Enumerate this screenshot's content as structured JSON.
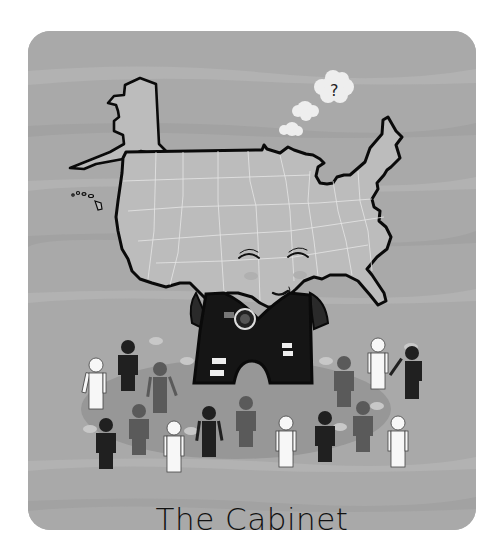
{
  "illustration": {
    "title": "The Cabinet",
    "thought_bubble_text": "?",
    "colors": {
      "background": "#a9a9a9",
      "stripe_light": "#b4b4b4",
      "stripe_dark": "#a0a0a0",
      "map_fill": "#bcbcbc",
      "map_outline": "#0a0a0a",
      "state_lines": "#e6e6e6",
      "shadow_ellipse": "#979797",
      "bubble": "#eeeeee",
      "suit": "#151515",
      "figure_white": "#f7f7f7",
      "figure_black": "#202020",
      "figure_gray": "#5a5a5a"
    },
    "figures": [
      {
        "tone": "white",
        "x": 52,
        "y": 316
      },
      {
        "tone": "black",
        "x": 80,
        "y": 294
      },
      {
        "tone": "gray",
        "x": 112,
        "y": 312
      },
      {
        "tone": "gray",
        "x": 295,
        "y": 308
      },
      {
        "tone": "white",
        "x": 329,
        "y": 294
      },
      {
        "tone": "black",
        "x": 366,
        "y": 302
      },
      {
        "tone": "black",
        "x": 49,
        "y": 376
      },
      {
        "tone": "gray",
        "x": 82,
        "y": 363
      },
      {
        "tone": "white",
        "x": 117,
        "y": 380
      },
      {
        "tone": "black",
        "x": 151,
        "y": 365
      },
      {
        "tone": "gray",
        "x": 189,
        "y": 355
      },
      {
        "tone": "white",
        "x": 255,
        "y": 375
      },
      {
        "tone": "black",
        "x": 296,
        "y": 368
      },
      {
        "tone": "gray",
        "x": 334,
        "y": 360
      },
      {
        "tone": "white",
        "x": 367,
        "y": 374
      }
    ]
  }
}
